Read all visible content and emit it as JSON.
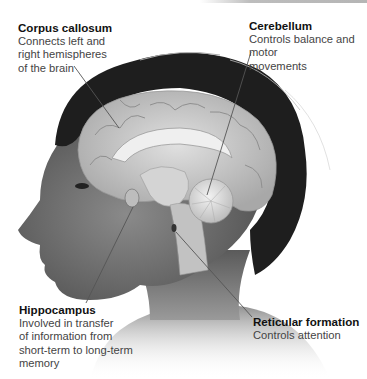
{
  "figure": {
    "labels": [
      {
        "id": "corpus-callosum",
        "title": "Corpus callosum",
        "description": "Connects left and\nright hemispheres\nof the brain"
      },
      {
        "id": "cerebellum",
        "title": "Cerebellum",
        "description": "Controls balance and motor\nmovements"
      },
      {
        "id": "hippocampus",
        "title": "Hippocampus",
        "description": "Involved in transfer\nof information from\nshort-term to long-term\nmemory"
      },
      {
        "id": "reticular-formation",
        "title": "Reticular formation",
        "description": "Controls attention"
      }
    ],
    "colors": {
      "background": "#ffffff",
      "title_text": "#111111",
      "body_text": "#444444",
      "hair": "#1c1c1c",
      "skin": "#6e6e6e",
      "brain": "#c9c9c9",
      "leader_line": "#555555"
    }
  }
}
